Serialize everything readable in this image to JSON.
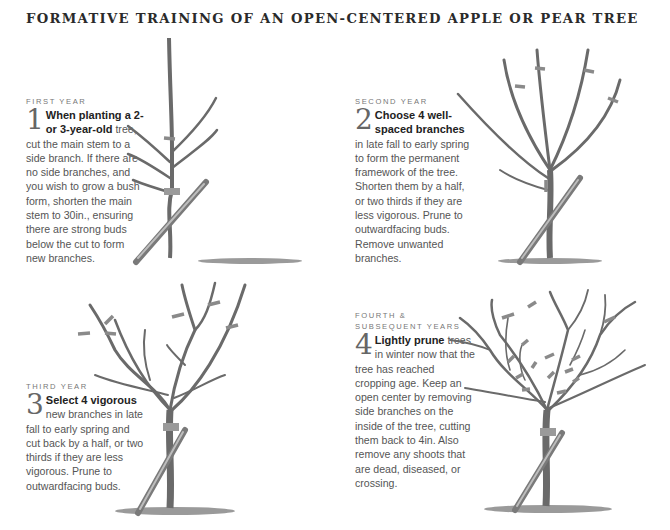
{
  "title": "FORMATIVE TRAINING OF AN OPEN-CENTERED APPLE OR PEAR TREE",
  "steps": [
    {
      "label": "FIRST YEAR",
      "number": "1",
      "lead": "When planting a 2- or 3-year-old",
      "body": " tree, cut the main stem to a side branch. If there are no side branches, and you wish to grow a bush form, shorten the main stem to 30in., ensuring there are strong buds below the cut to form new branches."
    },
    {
      "label": "SECOND YEAR",
      "number": "2",
      "lead": "Choose 4 well-spaced branches",
      "body": " in late fall to early spring to form the permanent framework of the tree. Shorten them by a half, or two thirds if they are less vigorous. Prune to outwardfacing buds. Remove unwanted branches."
    },
    {
      "label": "THIRD YEAR",
      "number": "3",
      "lead": "Select 4 vigorous",
      "body": " new branches in late fall to early spring and cut back by a half, or two thirds if they are less vigorous. Prune to outwardfacing buds."
    },
    {
      "label": "FOURTH & SUBSEQUENT YEARS",
      "number": "4",
      "lead": "Lightly prune",
      "body": " trees in winter now that the tree has reached cropping age. Keep an open center by removing side branches on the inside of the tree, cutting them back to 4in. Also remove any shoots that are dead, diseased, or crossing."
    }
  ],
  "illustrations": [
    {
      "name": "first-year-tree",
      "cut_marks": 1
    },
    {
      "name": "second-year-tree",
      "cut_marks": 4
    },
    {
      "name": "third-year-tree",
      "cut_marks": 6
    },
    {
      "name": "mature-tree",
      "cut_marks": 14
    }
  ]
}
